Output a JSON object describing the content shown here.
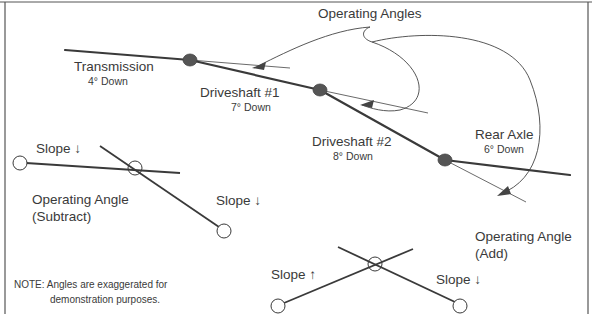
{
  "title": "Operating Angles",
  "components": [
    {
      "name": "Transmission",
      "angle": "4° Down"
    },
    {
      "name": "Driveshaft #1",
      "angle": "7° Down"
    },
    {
      "name": "Driveshaft #2",
      "angle": "8° Down"
    },
    {
      "name": "Rear Axle",
      "angle": "6° Down"
    }
  ],
  "subtract_example": {
    "label_line1": "Operating Angle",
    "label_line2": "(Subtract)",
    "slope_a": "Slope ↓",
    "slope_b": "Slope ↓"
  },
  "add_example": {
    "label_line1": "Operating Angle",
    "label_line2": "(Add)",
    "slope_a": "Slope ↑",
    "slope_b": "Slope ↓"
  },
  "note": {
    "line1": "NOTE: Angles are exaggerated for",
    "line2": "demonstration purposes."
  },
  "colors": {
    "line": "#3a3a3a",
    "joint": "#4a4a4a",
    "text": "#3a3a3a",
    "background": "#ffffff"
  }
}
